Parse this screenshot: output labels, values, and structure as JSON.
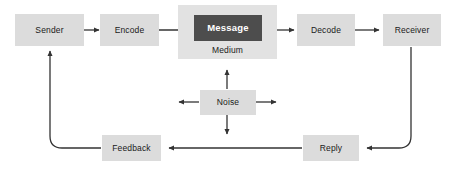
{
  "diagram": {
    "type": "flowchart",
    "colors": {
      "background": "#ffffff",
      "node_fill": "#dcdcdc",
      "medium_fill": "#e2e2e2",
      "message_fill": "#4d4d4d",
      "message_text": "#ffffff",
      "node_text": "#1a1a1a",
      "connector": "#333333"
    },
    "nodes": {
      "sender": {
        "label": "Sender"
      },
      "encode": {
        "label": "Encode"
      },
      "medium": {
        "label": "Medium"
      },
      "message": {
        "label": "Message"
      },
      "decode": {
        "label": "Decode"
      },
      "receiver": {
        "label": "Receiver"
      },
      "noise": {
        "label": "Noise"
      },
      "feedback": {
        "label": "Feedback"
      },
      "reply": {
        "label": "Reply"
      }
    },
    "connectors": [
      {
        "name": "sender-to-encode",
        "from": "Sender",
        "to": "Encode",
        "direction": "right"
      },
      {
        "name": "encode-to-message",
        "from": "Encode",
        "to": "Message",
        "direction": "right"
      },
      {
        "name": "message-to-decode",
        "from": "Message",
        "to": "Decode",
        "direction": "right"
      },
      {
        "name": "decode-to-receiver",
        "from": "Decode",
        "to": "Receiver",
        "direction": "right"
      },
      {
        "name": "receiver-to-reply",
        "from": "Receiver",
        "to": "Reply",
        "direction": "down-left"
      },
      {
        "name": "reply-to-feedback",
        "from": "Reply",
        "to": "Feedback",
        "direction": "left"
      },
      {
        "name": "feedback-to-sender",
        "from": "Feedback",
        "to": "Sender",
        "direction": "left-up"
      },
      {
        "name": "noise-up",
        "from": "Noise",
        "to": "Medium",
        "direction": "up"
      },
      {
        "name": "noise-down",
        "from": "Noise",
        "to": "Feedback channel",
        "direction": "down"
      },
      {
        "name": "noise-left",
        "from": "Noise",
        "to": "",
        "direction": "left"
      },
      {
        "name": "noise-right",
        "from": "Noise",
        "to": "",
        "direction": "right"
      }
    ]
  }
}
